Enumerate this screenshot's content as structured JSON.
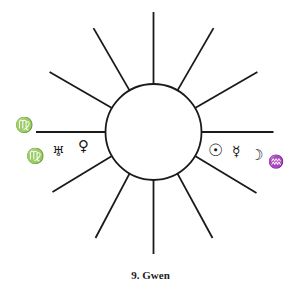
{
  "diagram": {
    "title": "9. Gwen",
    "center": [
      153.5,
      132
    ],
    "inner_radius": 48,
    "outer_radius": 120,
    "ray_count": 12,
    "stroke_color": "#1a1a1a",
    "left_symbols": {
      "row1": "♍",
      "row2": [
        "♍",
        "♅",
        "♀"
      ]
    },
    "right_symbols": [
      "☉",
      "☿",
      "☽",
      "♒"
    ]
  }
}
